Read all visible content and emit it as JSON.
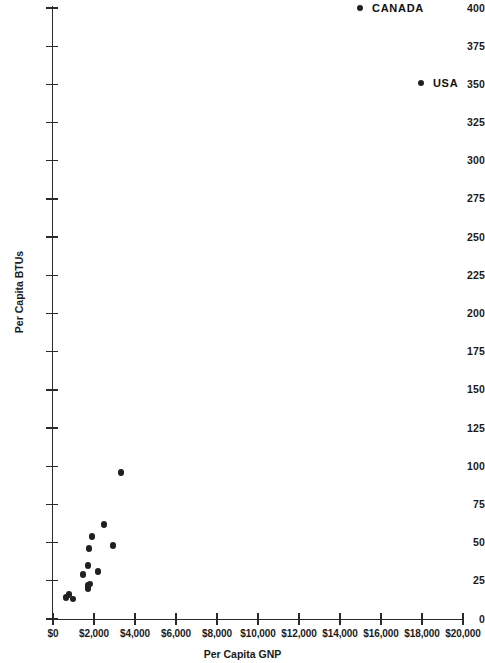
{
  "chart_data": {
    "type": "scatter",
    "title": "",
    "xlabel": "Per Capita GNP",
    "ylabel": "Per Capita BTUs",
    "xlim": [
      0,
      20000
    ],
    "ylim": [
      0,
      400
    ],
    "grid": false,
    "legend": "none",
    "x_ticks": [
      0,
      2000,
      4000,
      6000,
      8000,
      10000,
      12000,
      14000,
      16000,
      18000,
      20000
    ],
    "x_tick_labels": [
      "$0",
      "$2,000",
      "$4,000",
      "$6,000",
      "$8,000",
      "$10,000",
      "$12,000",
      "$14,000",
      "$16,000",
      "$18,000",
      "$20,000"
    ],
    "y_ticks": [
      0,
      25,
      50,
      75,
      100,
      125,
      150,
      175,
      200,
      225,
      250,
      275,
      300,
      325,
      350,
      375,
      400
    ],
    "y_tick_labels": [
      "0",
      "25",
      "50",
      "75",
      "100",
      "125",
      "150",
      "175",
      "200",
      "225",
      "250",
      "275",
      "300",
      "325",
      "350",
      "375",
      "400"
    ],
    "points": [
      {
        "x": 14980,
        "y": 400,
        "label": "CANADA"
      },
      {
        "x": 17950,
        "y": 351,
        "label": "USA"
      },
      {
        "x": 3320,
        "y": 96,
        "label": ""
      },
      {
        "x": 2490,
        "y": 62,
        "label": ""
      },
      {
        "x": 1900,
        "y": 54,
        "label": ""
      },
      {
        "x": 2930,
        "y": 48,
        "label": ""
      },
      {
        "x": 1760,
        "y": 46,
        "label": ""
      },
      {
        "x": 1710,
        "y": 35,
        "label": ""
      },
      {
        "x": 2190,
        "y": 31,
        "label": ""
      },
      {
        "x": 1460,
        "y": 29,
        "label": ""
      },
      {
        "x": 1810,
        "y": 23,
        "label": ""
      },
      {
        "x": 1710,
        "y": 22,
        "label": ""
      },
      {
        "x": 1710,
        "y": 20,
        "label": ""
      },
      {
        "x": 780,
        "y": 16,
        "label": ""
      },
      {
        "x": 630,
        "y": 14,
        "label": ""
      },
      {
        "x": 980,
        "y": 13,
        "label": ""
      }
    ],
    "annotations": [
      {
        "text": "CANADA",
        "x": 14980,
        "y": 400
      },
      {
        "text": "USA",
        "x": 17950,
        "y": 351
      }
    ]
  },
  "colors": {
    "marker": "#202020",
    "axis": "#2a2a2a",
    "text": "#1a1a1a",
    "background": "#ffffff"
  }
}
